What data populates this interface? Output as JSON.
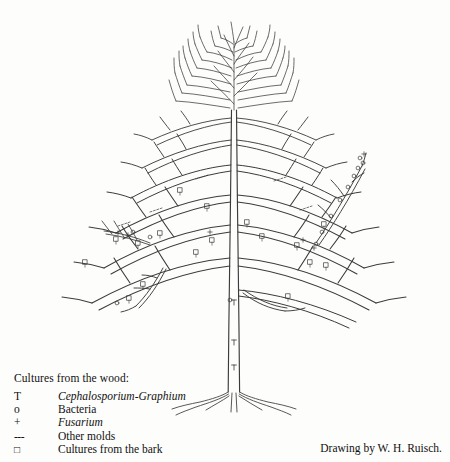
{
  "figure": {
    "line_color": "#3b3b3b",
    "background_color": "#fdfdfc"
  },
  "legend": {
    "title": "Cultures from the wood:",
    "rows": [
      {
        "symbol": "T",
        "label": "Cephalosporium-Graphium",
        "italic": true,
        "name": "cephalosporium-graphium"
      },
      {
        "symbol": "o",
        "label": "Bacteria",
        "italic": false,
        "name": "bacteria"
      },
      {
        "symbol": "+",
        "label": "Fusarium",
        "italic": true,
        "name": "fusarium"
      },
      {
        "symbol": "---",
        "label": "Other molds",
        "italic": false,
        "name": "other-molds"
      },
      {
        "symbol": "□",
        "label": "Cultures from the bark",
        "italic": false,
        "name": "cultures-from-bark"
      }
    ]
  },
  "credit": {
    "text": "Drawing by W. H. Ruisch."
  },
  "markers": {
    "trunk_T": [
      "T",
      "T"
    ],
    "note": "small T, o, + and square glyphs drawn along branches"
  }
}
